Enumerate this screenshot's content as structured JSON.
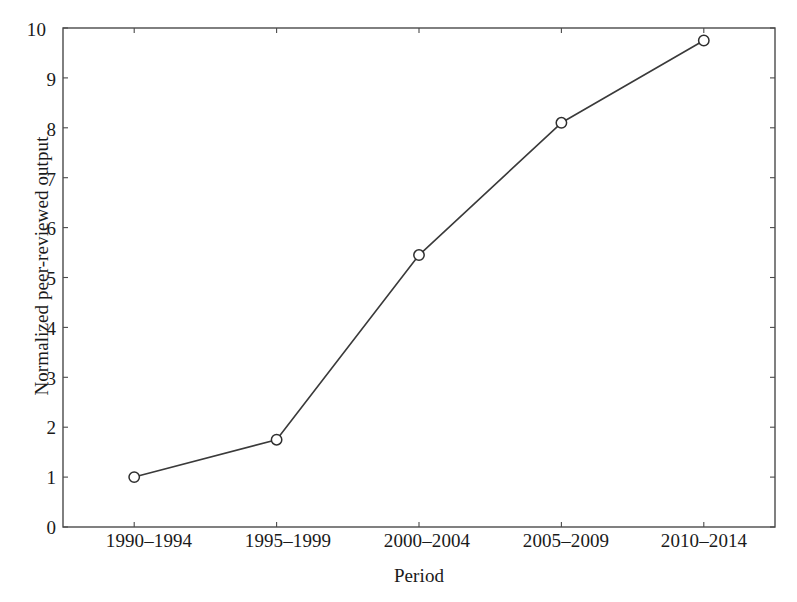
{
  "chart_data": {
    "type": "line",
    "title": "",
    "subtitle": "",
    "xlabel": "Period",
    "ylabel": "Normalized peer-reviewed output",
    "categories": [
      "1990–1994",
      "1995–1999",
      "2000–2004",
      "2005–2009",
      "2010–2014"
    ],
    "values": [
      1.0,
      1.75,
      5.45,
      8.1,
      9.75
    ],
    "series": [
      {
        "name": "Normalized peer-reviewed output",
        "values": [
          1.0,
          1.75,
          5.45,
          8.1,
          9.75
        ]
      }
    ],
    "ylim": [
      0,
      10
    ],
    "ytick_labels": [
      "0",
      "1",
      "2",
      "3",
      "4",
      "5",
      "6",
      "7",
      "8",
      "9",
      "10"
    ],
    "ytick_values": [
      0,
      1,
      2,
      3,
      4,
      5,
      6,
      7,
      8,
      9,
      10
    ],
    "xtick_labels": [
      "1990–1994",
      "1995–1999",
      "2000–2004",
      "2005–2009",
      "2010–2014"
    ],
    "grid": false,
    "legend": "none",
    "marker": "open-circle",
    "annotations": [],
    "colors": {
      "line": "#3a3a3a",
      "marker_stroke": "#2e2e2e",
      "marker_fill": "#ffffff",
      "axis": "#4a4a4a",
      "text": "#1a1a1a",
      "background": "#ffffff"
    }
  }
}
